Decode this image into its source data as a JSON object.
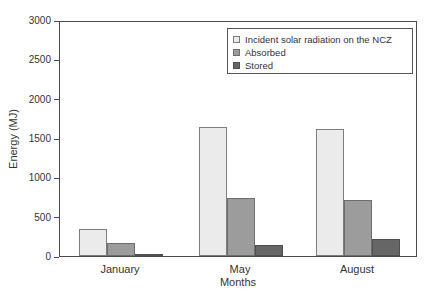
{
  "chart_data": {
    "type": "bar",
    "title": "",
    "xlabel": "Months",
    "ylabel": "Energy (MJ)",
    "categories": [
      "January",
      "May",
      "August"
    ],
    "series": [
      {
        "name": "Incident solar radiation on the NCZ",
        "fill": "#ebebeb",
        "border": "#7d7d7d",
        "textured": true,
        "values": [
          350,
          1650,
          1630
        ]
      },
      {
        "name": "Absorbed",
        "fill": "#9c9c9c",
        "border": "#6e6e6e",
        "textured": false,
        "values": [
          170,
          750,
          720
        ]
      },
      {
        "name": "Stored",
        "fill": "#666666",
        "border": "#4f4f4f",
        "textured": false,
        "values": [
          25,
          140,
          215
        ]
      }
    ],
    "ylim": [
      0,
      3000
    ],
    "ytick_step": 500,
    "ytick_labels": [
      "0",
      "500",
      "1000",
      "1500",
      "2000",
      "2500",
      "3000"
    ],
    "grid": false,
    "legend_position": "top-right-inside",
    "frame_color": "#4a4a4a",
    "background_color": "#ffffff"
  }
}
